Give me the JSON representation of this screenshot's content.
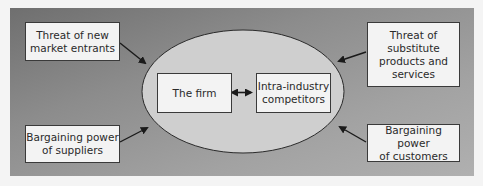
{
  "diagram": {
    "colors": {
      "panel_dark": "#6f6f6f",
      "panel_light": "#b0b0b0",
      "ellipse_fill": "#cfcfcf",
      "box_fill": "#f3f3f3",
      "stroke": "#2a2a2a"
    },
    "center": {
      "firm": "The firm",
      "competitors": {
        "line1": "Intra-industry",
        "line2": "competitors"
      },
      "relation": "double-arrow"
    },
    "forces": {
      "top_left": {
        "line1": "Threat of new",
        "line2": "market entrants"
      },
      "top_right": {
        "line1": "Threat of",
        "line2": "substitute",
        "line3": "products and",
        "line4": "services"
      },
      "bottom_left": {
        "line1": "Bargaining power",
        "line2": "of suppliers"
      },
      "bottom_right": {
        "line1": "Bargaining power",
        "line2": "of customers"
      }
    }
  }
}
